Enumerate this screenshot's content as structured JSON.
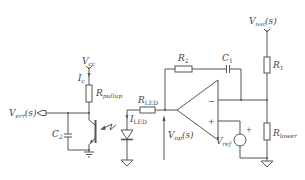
{
  "diagram": {
    "colors": {
      "stroke": "#555555",
      "text": "#444444",
      "background": "#ffffff"
    },
    "labels": {
      "vcc": {
        "main": "V",
        "sub": "cc"
      },
      "ic": {
        "main": "I",
        "sub": "c"
      },
      "rpullup": {
        "main": "R",
        "sub": "pullup"
      },
      "verr": {
        "main": "V",
        "sub": "err",
        "suffix": "(s)"
      },
      "c2": {
        "main": "C",
        "sub": "2"
      },
      "rled": {
        "main": "R",
        "sub": "LED"
      },
      "iled": {
        "main": "I",
        "sub": "LED"
      },
      "vop": {
        "main": "V",
        "sub": "op",
        "suffix": "(s)"
      },
      "r2": {
        "main": "R",
        "sub": "2"
      },
      "c1": {
        "main": "C",
        "sub": "1"
      },
      "vtest": {
        "main": "V",
        "sub": "test",
        "suffix": "(s)"
      },
      "r1": {
        "main": "R",
        "sub": "1"
      },
      "rlower": {
        "main": "R",
        "sub": "lower"
      },
      "vref": {
        "main": "V",
        "sub": "ref"
      },
      "opamp_minus": "−",
      "opamp_plus": "+",
      "vref_plus": "+"
    },
    "components": [
      {
        "id": "rpullup",
        "type": "resistor",
        "icon": "resistor-icon"
      },
      {
        "id": "c2",
        "type": "capacitor",
        "icon": "capacitor-icon"
      },
      {
        "id": "phototransistor",
        "type": "phototransistor",
        "icon": "transistor-icon"
      },
      {
        "id": "led",
        "type": "led",
        "icon": "led-icon"
      },
      {
        "id": "rled",
        "type": "resistor",
        "icon": "resistor-icon"
      },
      {
        "id": "opamp",
        "type": "op-amp",
        "icon": "opamp-icon"
      },
      {
        "id": "r2",
        "type": "resistor",
        "icon": "resistor-icon"
      },
      {
        "id": "c1",
        "type": "capacitor",
        "icon": "capacitor-icon"
      },
      {
        "id": "r1",
        "type": "resistor",
        "icon": "resistor-icon"
      },
      {
        "id": "rlower",
        "type": "resistor",
        "icon": "resistor-icon"
      },
      {
        "id": "vref",
        "type": "voltage-source",
        "icon": "voltage-source-icon"
      }
    ]
  }
}
